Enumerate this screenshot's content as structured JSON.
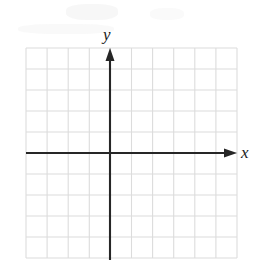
{
  "figure": {
    "width": 266,
    "height": 272,
    "background_color": "#ffffff"
  },
  "labels": {
    "x_axis": "x",
    "y_axis": "y"
  },
  "colors": {
    "grid": "#dcdcdc",
    "axis": "#262626",
    "label": "#1a1a1a",
    "background": "#ffffff"
  },
  "chart_data": {
    "type": "scatter",
    "title": "",
    "xlabel": "x",
    "ylabel": "y",
    "x": [],
    "y": [],
    "series": [],
    "grid": true,
    "legend": false,
    "xlim": [
      -4,
      6
    ],
    "ylim": [
      -5,
      5
    ],
    "xticks": [
      -4,
      -3,
      -2,
      -1,
      0,
      1,
      2,
      3,
      4,
      5,
      6
    ],
    "yticks": [
      -5,
      -4,
      -3,
      -2,
      -1,
      0,
      1,
      2,
      3,
      4,
      5
    ],
    "tick_labels_shown": false,
    "grid_columns": 10,
    "grid_rows": 10,
    "cell_size_px": 21.1,
    "origin_px": [
      110,
      153
    ],
    "grid_bounds_px": {
      "left": 26,
      "top": 48,
      "right": 237,
      "bottom": 258
    },
    "axis_arrows": {
      "x_positive": true,
      "x_negative": false,
      "y_positive": true,
      "y_negative": false
    },
    "annotations": []
  }
}
